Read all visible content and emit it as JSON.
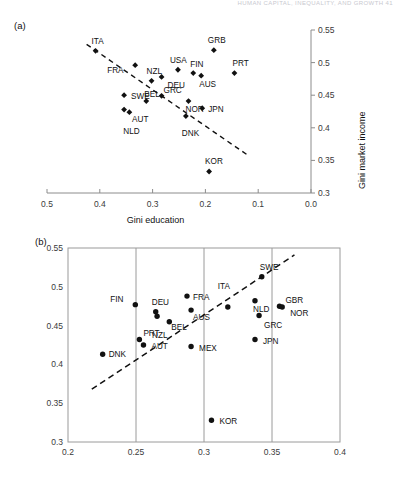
{
  "running_head": "HUMAN CAPITAL, INEQUALITY, AND GROWTH    41",
  "panels": {
    "a": {
      "label": "(a)",
      "xlabel": "Gini education",
      "ylabel": "Gini market income",
      "xticks": [
        "0.5",
        "0.4",
        "0.3",
        "0.2",
        "0.1",
        "0.0"
      ],
      "yticks": [
        "0.3",
        "0.35",
        "0.4",
        "0.45",
        "0.5",
        "0.55"
      ]
    },
    "b": {
      "label": "(b)",
      "xlabel": "",
      "ylabel": "",
      "xticks": [
        "0.2",
        "0.25",
        "0.3",
        "0.35",
        "0.4"
      ],
      "yticks": [
        "0.3",
        "0.35",
        "0.4",
        "0.45",
        "0.5",
        "0.55"
      ]
    }
  },
  "chart_data": [
    {
      "type": "scatter",
      "panel": "(a)",
      "title": "",
      "xlabel": "Gini education",
      "ylabel": "Gini market income",
      "xlim": [
        0.5,
        0.0
      ],
      "ylim": [
        0.3,
        0.55
      ],
      "x_reversed": true,
      "grid": false,
      "legend": "none",
      "marker": "filled-diamond",
      "xticks": [
        0.5,
        0.4,
        0.3,
        0.2,
        0.1,
        0.0
      ],
      "yticks": [
        0.3,
        0.35,
        0.4,
        0.45,
        0.5,
        0.55
      ],
      "points": [
        {
          "label": "ITA",
          "x": 0.408,
          "y": 0.518,
          "lx": -4,
          "ly": -13
        },
        {
          "label": "FRA",
          "x": 0.333,
          "y": 0.496,
          "lx": -28,
          "ly": 2
        },
        {
          "label": "NZL",
          "x": 0.302,
          "y": 0.472,
          "lx": -5,
          "ly": -13
        },
        {
          "label": "USA",
          "x": 0.252,
          "y": 0.489,
          "lx": -8,
          "ly": -13
        },
        {
          "label": "FIN",
          "x": 0.223,
          "y": 0.484,
          "lx": -3,
          "ly": -12
        },
        {
          "label": "GRB",
          "x": 0.184,
          "y": 0.519,
          "lx": -6,
          "ly": -13
        },
        {
          "label": "PRT",
          "x": 0.145,
          "y": 0.484,
          "lx": -2,
          "ly": -13
        },
        {
          "label": "DEU",
          "x": 0.283,
          "y": 0.478,
          "lx": 6,
          "ly": 5
        },
        {
          "label": "AUS",
          "x": 0.208,
          "y": 0.48,
          "lx": -2,
          "ly": 5
        },
        {
          "label": "SWE",
          "x": 0.354,
          "y": 0.45,
          "lx": 7,
          "ly": -2
        },
        {
          "label": "BEL",
          "x": 0.312,
          "y": 0.441,
          "lx": -2,
          "ly": -10
        },
        {
          "label": "GRC",
          "x": 0.283,
          "y": 0.449,
          "lx": 2,
          "ly": -9
        },
        {
          "label": "NOR",
          "x": 0.232,
          "y": 0.441,
          "lx": -3,
          "ly": 5
        },
        {
          "label": "JPN",
          "x": 0.206,
          "y": 0.43,
          "lx": 6,
          "ly": -2
        },
        {
          "label": "AUT",
          "x": 0.354,
          "y": 0.428,
          "lx": 8,
          "ly": 6
        },
        {
          "label": "NLD",
          "x": 0.344,
          "y": 0.424,
          "lx": -6,
          "ly": 16
        },
        {
          "label": "DNK",
          "x": 0.237,
          "y": 0.418,
          "lx": -4,
          "ly": 14
        },
        {
          "label": "KOR",
          "x": 0.193,
          "y": 0.333,
          "lx": -4,
          "ly": -13
        }
      ],
      "trendline": {
        "x1": 0.425,
        "y1": 0.528,
        "x2": 0.118,
        "y2": 0.357,
        "style": "dashed"
      }
    },
    {
      "type": "scatter",
      "panel": "(b)",
      "title": "",
      "xlabel": "",
      "ylabel": "",
      "xlim": [
        0.2,
        0.4
      ],
      "ylim": [
        0.3,
        0.55
      ],
      "x_reversed": false,
      "grid": true,
      "gridlines_x": [
        0.25,
        0.3,
        0.35
      ],
      "legend": "none",
      "marker": "filled-circle",
      "xticks": [
        0.2,
        0.25,
        0.3,
        0.35,
        0.4
      ],
      "yticks": [
        0.3,
        0.35,
        0.4,
        0.45,
        0.5,
        0.55
      ],
      "points": [
        {
          "label": "DNK",
          "x": 0.2255,
          "y": 0.413,
          "lx": 6,
          "ly": -3
        },
        {
          "label": "FIN",
          "x": 0.2495,
          "y": 0.477,
          "lx": -25,
          "ly": -9
        },
        {
          "label": "PRT",
          "x": 0.2525,
          "y": 0.432,
          "lx": 4,
          "ly": -10
        },
        {
          "label": "AUT",
          "x": 0.2555,
          "y": 0.425,
          "lx": 8,
          "ly": -2
        },
        {
          "label": "DEU",
          "x": 0.2645,
          "y": 0.468,
          "lx": -4,
          "ly": -13
        },
        {
          "label": "NZL",
          "x": 0.2655,
          "y": 0.462,
          "lx": -5,
          "ly": 16
        },
        {
          "label": "BEL",
          "x": 0.2745,
          "y": 0.455,
          "lx": 2,
          "ly": 2
        },
        {
          "label": "FRA",
          "x": 0.2875,
          "y": 0.488,
          "lx": 6,
          "ly": -2
        },
        {
          "label": "AUS",
          "x": 0.2905,
          "y": 0.47,
          "lx": 2,
          "ly": 4
        },
        {
          "label": "MEX",
          "x": 0.2905,
          "y": 0.423,
          "lx": 8,
          "ly": -2
        },
        {
          "label": "ITA",
          "x": 0.3175,
          "y": 0.474,
          "lx": -10,
          "ly": -24
        },
        {
          "label": "KOR",
          "x": 0.3055,
          "y": 0.328,
          "lx": 8,
          "ly": -2
        },
        {
          "label": "NLD",
          "x": 0.3375,
          "y": 0.482,
          "lx": -2,
          "ly": 5
        },
        {
          "label": "SWE",
          "x": 0.3425,
          "y": 0.513,
          "lx": -2,
          "ly": -13
        },
        {
          "label": "GRC",
          "x": 0.3405,
          "y": 0.463,
          "lx": 5,
          "ly": 6
        },
        {
          "label": "JPN",
          "x": 0.3375,
          "y": 0.432,
          "lx": 8,
          "ly": -2
        },
        {
          "label": "GBR",
          "x": 0.3555,
          "y": 0.475,
          "lx": 6,
          "ly": -9
        },
        {
          "label": "NOR",
          "x": 0.3575,
          "y": 0.474,
          "lx": 8,
          "ly": 3
        }
      ],
      "trendline": {
        "x1": 0.2175,
        "y1": 0.368,
        "x2": 0.3665,
        "y2": 0.541,
        "style": "dashed"
      }
    }
  ]
}
